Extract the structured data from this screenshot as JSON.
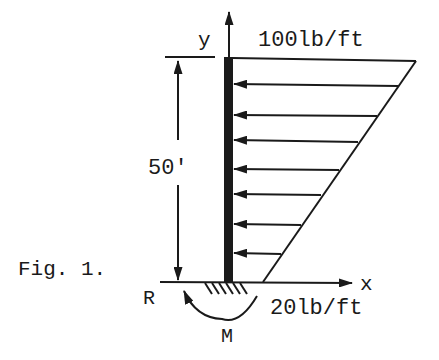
{
  "figure": {
    "caption": "Fig. 1.",
    "axis_y_label": "y",
    "axis_x_label": "x",
    "top_load_label": "100lb/ft",
    "bottom_load_label": "20lb/ft",
    "height_dimension_label": "50'",
    "reaction_label": "R",
    "moment_label": "M",
    "load_arrow_count": 7,
    "colors": {
      "ink": "#1a1a1a",
      "background": "#ffffff"
    }
  }
}
